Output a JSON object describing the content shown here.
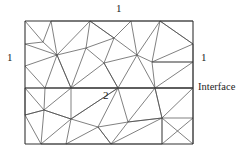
{
  "figure": {
    "title": "",
    "type": "triangular-finite-element-mesh",
    "labels": {
      "top": "1",
      "left": "1",
      "right": "1",
      "interface": "Interface",
      "region_lower": "2"
    },
    "colors": {
      "background": "#ffffff",
      "mesh_stroke": "#4a4a4a",
      "frame_stroke": "#333333",
      "text": "#1d1d1d"
    },
    "domain": {
      "x_min": 25,
      "y_min": 21,
      "x_max": 193,
      "y_max": 144,
      "interface_y": 88
    },
    "mesh": {
      "frame": [
        [
          25,
          21,
          193,
          21
        ],
        [
          193,
          21,
          193,
          144
        ],
        [
          193,
          144,
          25,
          144
        ],
        [
          25,
          144,
          25,
          21
        ]
      ],
      "interface": [
        [
          25,
          88,
          193,
          88
        ]
      ],
      "edges": [
        [
          25,
          21,
          43,
          42
        ],
        [
          43,
          42,
          51,
          21
        ],
        [
          25,
          44,
          43,
          42
        ],
        [
          25,
          44,
          57,
          55
        ],
        [
          43,
          42,
          57,
          55
        ],
        [
          51,
          21,
          57,
          55
        ],
        [
          25,
          66,
          57,
          55
        ],
        [
          25,
          66,
          45,
          88
        ],
        [
          57,
          55,
          45,
          88
        ],
        [
          45,
          88,
          71,
          88
        ],
        [
          57,
          55,
          71,
          88
        ],
        [
          51,
          21,
          90,
          21
        ],
        [
          57,
          55,
          90,
          21
        ],
        [
          57,
          55,
          86,
          48
        ],
        [
          86,
          48,
          90,
          21
        ],
        [
          86,
          48,
          114,
          38
        ],
        [
          90,
          21,
          114,
          38
        ],
        [
          86,
          48,
          104,
          63
        ],
        [
          114,
          38,
          104,
          63
        ],
        [
          57,
          55,
          71,
          88
        ],
        [
          86,
          48,
          71,
          88
        ],
        [
          71,
          88,
          104,
          63
        ],
        [
          104,
          63,
          118,
          88
        ],
        [
          71,
          88,
          118,
          88
        ],
        [
          90,
          21,
          114,
          38
        ],
        [
          114,
          38,
          131,
          21
        ],
        [
          90,
          21,
          131,
          21
        ],
        [
          114,
          38,
          137,
          55
        ],
        [
          131,
          21,
          137,
          55
        ],
        [
          104,
          63,
          137,
          55
        ],
        [
          104,
          63,
          118,
          88
        ],
        [
          137,
          55,
          118,
          88
        ],
        [
          131,
          21,
          160,
          21
        ],
        [
          137,
          55,
          160,
          21
        ],
        [
          160,
          21,
          152,
          62
        ],
        [
          137,
          55,
          152,
          62
        ],
        [
          152,
          62,
          193,
          62
        ],
        [
          160,
          21,
          193,
          21
        ],
        [
          160,
          21,
          193,
          44
        ],
        [
          193,
          44,
          193,
          62
        ],
        [
          160,
          21,
          193,
          44
        ],
        [
          152,
          62,
          193,
          44
        ],
        [
          137,
          55,
          155,
          88
        ],
        [
          152,
          62,
          155,
          88
        ],
        [
          118,
          88,
          155,
          88
        ],
        [
          152,
          62,
          193,
          62
        ],
        [
          155,
          88,
          193,
          62
        ],
        [
          155,
          88,
          193,
          88
        ],
        [
          193,
          62,
          193,
          88
        ],
        [
          25,
          88,
          45,
          88
        ],
        [
          45,
          88,
          71,
          88
        ],
        [
          71,
          88,
          118,
          88
        ],
        [
          118,
          88,
          155,
          88
        ],
        [
          155,
          88,
          193,
          88
        ],
        [
          25,
          88,
          44,
          110
        ],
        [
          45,
          88,
          44,
          110
        ],
        [
          25,
          115,
          44,
          110
        ],
        [
          25,
          88,
          25,
          115
        ],
        [
          44,
          110,
          71,
          88
        ],
        [
          44,
          110,
          71,
          119
        ],
        [
          71,
          88,
          71,
          119
        ],
        [
          71,
          119,
          118,
          88
        ],
        [
          71,
          88,
          118,
          88
        ],
        [
          25,
          115,
          41,
          144
        ],
        [
          25,
          115,
          44,
          110
        ],
        [
          44,
          110,
          41,
          144
        ],
        [
          41,
          144,
          71,
          119
        ],
        [
          44,
          110,
          71,
          119
        ],
        [
          41,
          144,
          66,
          144
        ],
        [
          66,
          144,
          71,
          119
        ],
        [
          71,
          119,
          98,
          127
        ],
        [
          66,
          144,
          98,
          127
        ],
        [
          71,
          119,
          118,
          88
        ],
        [
          98,
          127,
          118,
          88
        ],
        [
          98,
          127,
          128,
          122
        ],
        [
          118,
          88,
          128,
          122
        ],
        [
          98,
          127,
          111,
          144
        ],
        [
          66,
          144,
          111,
          144
        ],
        [
          98,
          127,
          111,
          144
        ],
        [
          111,
          144,
          128,
          122
        ],
        [
          128,
          122,
          155,
          88
        ],
        [
          118,
          88,
          155,
          88
        ],
        [
          128,
          122,
          162,
          118
        ],
        [
          155,
          88,
          162,
          118
        ],
        [
          111,
          144,
          162,
          118
        ],
        [
          128,
          122,
          162,
          118
        ],
        [
          155,
          88,
          193,
          88
        ],
        [
          155,
          88,
          162,
          118
        ],
        [
          162,
          118,
          193,
          88
        ],
        [
          162,
          118,
          193,
          118
        ],
        [
          193,
          88,
          193,
          118
        ],
        [
          162,
          118,
          162,
          144
        ],
        [
          162,
          118,
          193,
          144
        ],
        [
          193,
          118,
          193,
          144
        ],
        [
          162,
          144,
          193,
          118
        ],
        [
          111,
          144,
          162,
          144
        ],
        [
          162,
          144,
          162,
          118
        ]
      ]
    }
  }
}
